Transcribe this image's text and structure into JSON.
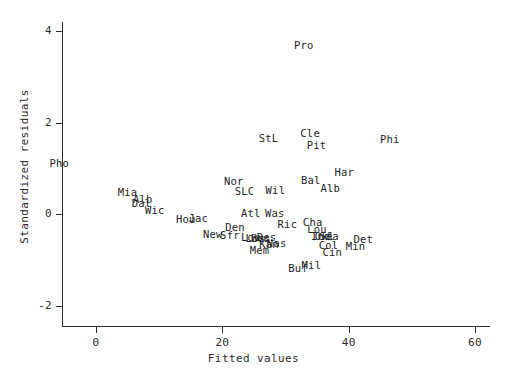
{
  "chart_data": {
    "type": "scatter",
    "title": "",
    "xlabel": "Fitted values",
    "ylabel": "Standardized residuals",
    "xlim": [
      -7,
      64
    ],
    "ylim": [
      -2.35,
      4.3
    ],
    "xticks": [
      0,
      20,
      40,
      60
    ],
    "xtick_labels": [
      "0",
      "20",
      "40",
      "60"
    ],
    "yticks": [
      -2,
      0,
      2,
      4
    ],
    "ytick_labels": [
      "-2",
      "0",
      "2",
      "4"
    ],
    "grid": false,
    "legend": "none",
    "marker": "text-label",
    "points": [
      {
        "label": "Pro",
        "x": 32.9,
        "y": 3.7
      },
      {
        "label": "StL",
        "x": 27.3,
        "y": 1.66
      },
      {
        "label": "Cle",
        "x": 33.9,
        "y": 1.78
      },
      {
        "label": "Pit",
        "x": 34.9,
        "y": 1.5
      },
      {
        "label": "Phi",
        "x": 46.5,
        "y": 1.64
      },
      {
        "label": "Pho",
        "x": -5.8,
        "y": 1.12
      },
      {
        "label": "Har",
        "x": 39.3,
        "y": 0.92
      },
      {
        "label": "Bal",
        "x": 34.0,
        "y": 0.74
      },
      {
        "label": "Alb",
        "x": 37.1,
        "y": 0.56
      },
      {
        "label": "Nor",
        "x": 21.8,
        "y": 0.72
      },
      {
        "label": "SLC",
        "x": 23.5,
        "y": 0.5
      },
      {
        "label": "Wil",
        "x": 28.4,
        "y": 0.53
      },
      {
        "label": "Mia",
        "x": 5.0,
        "y": 0.47
      },
      {
        "label": "Alb",
        "x": 7.4,
        "y": 0.32
      },
      {
        "label": "Dal",
        "x": 7.2,
        "y": 0.23
      },
      {
        "label": "Wic",
        "x": 9.3,
        "y": 0.08
      },
      {
        "label": "Atl",
        "x": 24.5,
        "y": 0.02
      },
      {
        "label": "Was",
        "x": 28.3,
        "y": 0.02
      },
      {
        "label": "Hou",
        "x": 14.2,
        "y": -0.12
      },
      {
        "label": "Jac",
        "x": 16.2,
        "y": -0.09
      },
      {
        "label": "Ric",
        "x": 30.3,
        "y": -0.21
      },
      {
        "label": "Cha",
        "x": 34.3,
        "y": -0.18
      },
      {
        "label": "Den",
        "x": 22.0,
        "y": -0.29
      },
      {
        "label": "Lou",
        "x": 35.0,
        "y": -0.33
      },
      {
        "label": "New",
        "x": 18.5,
        "y": -0.44
      },
      {
        "label": "Sfr",
        "x": 21.2,
        "y": -0.46
      },
      {
        "label": "Lou",
        "x": 24.5,
        "y": -0.51
      },
      {
        "label": "Los",
        "x": 25.2,
        "y": -0.52
      },
      {
        "label": "Bos",
        "x": 26.1,
        "y": -0.52
      },
      {
        "label": "Des",
        "x": 27.0,
        "y": -0.5
      },
      {
        "label": "Ind",
        "x": 35.6,
        "y": -0.48
      },
      {
        "label": "Okl",
        "x": 36.2,
        "y": -0.49
      },
      {
        "label": "Sea",
        "x": 36.9,
        "y": -0.48
      },
      {
        "label": "Det",
        "x": 42.3,
        "y": -0.55
      },
      {
        "label": "Kan",
        "x": 27.4,
        "y": -0.66
      },
      {
        "label": "Nas",
        "x": 28.6,
        "y": -0.63
      },
      {
        "label": "Col",
        "x": 36.8,
        "y": -0.67
      },
      {
        "label": "Min",
        "x": 41.1,
        "y": -0.7
      },
      {
        "label": "Mem",
        "x": 25.9,
        "y": -0.78
      },
      {
        "label": "Cin",
        "x": 37.4,
        "y": -0.82
      },
      {
        "label": "Buf",
        "x": 32.0,
        "y": -1.17
      },
      {
        "label": "Mil",
        "x": 34.1,
        "y": -1.12
      }
    ]
  }
}
